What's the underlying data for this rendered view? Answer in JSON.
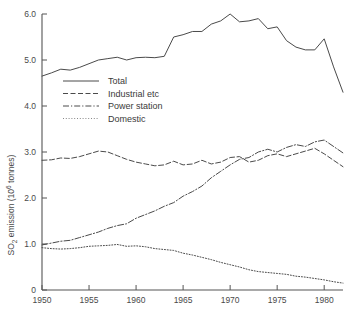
{
  "chart_data": {
    "type": "line",
    "title": "",
    "xlabel": "",
    "ylabel": "SO₂ emission (10⁶ tonnes)",
    "ylabel_parts": {
      "base": "SO",
      "sub": "2",
      "mid": " emission (10",
      "sup": "6",
      "tail": " tonnes)"
    },
    "xlim": [
      1950,
      1982
    ],
    "ylim": [
      0,
      6.0
    ],
    "grid": false,
    "legend_position": "upper-left-inside",
    "xticks": [
      1950,
      1955,
      1960,
      1965,
      1970,
      1975,
      1980
    ],
    "xtick_labels": [
      "1950",
      "1955",
      "1960",
      "1965",
      "1970",
      "1975",
      "1980"
    ],
    "yticks": [
      0,
      1.0,
      2.0,
      3.0,
      4.0,
      5.0,
      6.0
    ],
    "ytick_labels": [
      "0",
      "1.0",
      "2.0",
      "3.0",
      "4.0",
      "5.0",
      "6.0"
    ],
    "x": [
      1950,
      1951,
      1952,
      1953,
      1954,
      1955,
      1956,
      1957,
      1958,
      1959,
      1960,
      1961,
      1962,
      1963,
      1964,
      1965,
      1966,
      1967,
      1968,
      1969,
      1970,
      1971,
      1972,
      1973,
      1974,
      1975,
      1976,
      1977,
      1978,
      1979,
      1980,
      1981,
      1982
    ],
    "series": [
      {
        "name": "Total",
        "style": "solid",
        "color": "#4a4a4a",
        "values": [
          4.65,
          4.72,
          4.8,
          4.78,
          4.84,
          4.92,
          5.0,
          5.03,
          5.06,
          5.0,
          5.05,
          5.06,
          5.05,
          5.08,
          5.5,
          5.55,
          5.62,
          5.62,
          5.78,
          5.85,
          6.0,
          5.83,
          5.85,
          5.9,
          5.68,
          5.72,
          5.42,
          5.28,
          5.22,
          5.22,
          5.46,
          4.85,
          4.3
        ]
      },
      {
        "name": "Industrial etc",
        "style": "dashed",
        "color": "#4a4a4a",
        "values": [
          2.82,
          2.83,
          2.87,
          2.86,
          2.9,
          2.96,
          3.02,
          3.0,
          2.92,
          2.84,
          2.78,
          2.74,
          2.7,
          2.72,
          2.8,
          2.72,
          2.74,
          2.82,
          2.74,
          2.78,
          2.88,
          2.9,
          2.78,
          2.82,
          2.92,
          2.96,
          2.9,
          2.96,
          3.02,
          3.08,
          2.96,
          2.82,
          2.68
        ]
      },
      {
        "name": "Power station",
        "style": "dashdot",
        "color": "#4a4a4a",
        "values": [
          0.98,
          1.02,
          1.06,
          1.08,
          1.14,
          1.2,
          1.26,
          1.34,
          1.4,
          1.44,
          1.56,
          1.64,
          1.72,
          1.82,
          1.9,
          2.04,
          2.14,
          2.26,
          2.44,
          2.58,
          2.72,
          2.84,
          2.88,
          3.0,
          3.06,
          3.0,
          3.1,
          3.16,
          3.12,
          3.22,
          3.26,
          3.12,
          2.98
        ]
      },
      {
        "name": "Domestic",
        "style": "dotted",
        "color": "#7a7a7a",
        "values": [
          0.92,
          0.9,
          0.89,
          0.9,
          0.92,
          0.95,
          0.96,
          0.97,
          0.99,
          0.95,
          0.96,
          0.94,
          0.9,
          0.88,
          0.86,
          0.8,
          0.76,
          0.71,
          0.66,
          0.6,
          0.55,
          0.5,
          0.44,
          0.4,
          0.38,
          0.36,
          0.34,
          0.3,
          0.28,
          0.25,
          0.22,
          0.18,
          0.15
        ]
      }
    ]
  },
  "legend": {
    "entries": [
      {
        "label": "Total",
        "style": "solid"
      },
      {
        "label": "Industrial etc",
        "style": "dashed"
      },
      {
        "label": "Power station",
        "style": "dashdot"
      },
      {
        "label": "Domestic",
        "style": "dotted"
      }
    ]
  }
}
